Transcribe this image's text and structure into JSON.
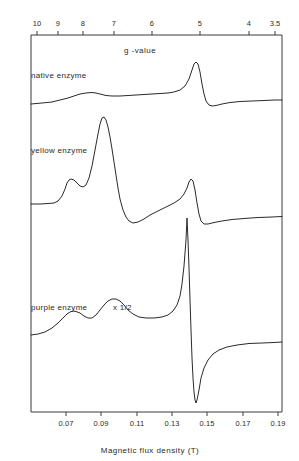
{
  "figure": {
    "kind": "epr-spectra-stack",
    "background_color": "#ffffff",
    "line_color": "#2a2a2a",
    "frame": {
      "left": 31,
      "right": 282,
      "top": 35,
      "bottom": 412
    }
  },
  "top_axis": {
    "title": "g -value",
    "title_x": 140,
    "title_y": 46,
    "ticks": [
      {
        "label": "10",
        "x": 37
      },
      {
        "label": "9",
        "x": 58
      },
      {
        "label": "8",
        "x": 83
      },
      {
        "label": "7",
        "x": 114
      },
      {
        "label": "6",
        "x": 152
      },
      {
        "label": "5",
        "x": 200
      },
      {
        "label": "4",
        "x": 249
      },
      {
        "label": "3.5",
        "x": 275
      }
    ]
  },
  "bottom_axis": {
    "title": "Magnetic  flux  density  (T)",
    "title_x": 150,
    "title_y": 446,
    "ticks": [
      {
        "label": "0.07",
        "x": 66
      },
      {
        "label": "0.09",
        "x": 101
      },
      {
        "label": "0.11",
        "x": 137
      },
      {
        "label": "0.13",
        "x": 172
      },
      {
        "label": "0.15",
        "x": 207
      },
      {
        "label": "0.17",
        "x": 243
      },
      {
        "label": "0.19",
        "x": 278
      }
    ]
  },
  "traces": [
    {
      "name": "native enzyme",
      "label": "native enzyme",
      "multiplier": "",
      "label_x": 31,
      "label_y": 71,
      "path": "M31,104 L42,103 L52,102 L60,100 L68,98 L74,96 L80,94 L86,93 L92,92.5 L96,93 L100,94 L106,95.5 L112,96 L120,96 L128,95.5 L136,95 L144,94.5 L152,94 L160,93.5 L168,93 L174,92 L180,90 L185,86 L189,79 L192,70 L194,64 L196,62 L198,64 L200,72 L202,84 L204,94 L206,101 L209,105 L212,106 L216,105.5 L222,104 L230,102.5 L240,101.5 L252,101 L264,100.5 L275,100 L282,100"
    },
    {
      "name": "yellow enzyme",
      "label": "yellow enzyme",
      "multiplier": "",
      "label_x": 31,
      "label_y": 146,
      "path": "M31,204 L40,204 L48,203.5 L54,203 L58,201 L62,196 L65,189 L67,183 L69,180 L71,179 L74,180 L77,183 L80,186 L83,187 L86,185 L89,178 L92,166 L95,150 L98,134 L100,124 L102,118 L104,117 L106,120 L108,127 L110,137 L112,149 L114,162 L116,175 L118,188 L120,199 L123,210 L126,217 L129,221 L133,223 L138,222 L144,219 L150,215 L158,211 L166,207 L174,203 L180,199 L184,194 L187,188 L189,182 L191,179 L193,181 L195,190 L197,203 L199,214 L201,221 L204,224 L208,224 L214,222.5 L222,221 L232,219.5 L244,218.5 L258,217.5 L272,217 L282,216.5"
    },
    {
      "name": "purple enzyme",
      "label": "purple enzyme",
      "multiplier": "x 1/2",
      "label_x": 31,
      "label_y": 303,
      "path": "M31,335 L38,334 L45,332 L52,328 L58,323 L63,318 L67,314 L70,312 L73,311 L76,311.5 L80,313 L84,316 L88,318 L92,318 L96,315 L100,310 L104,305 L108,301 L112,299 L116,299 L120,301 L124,305 L128,310 L133,314 L139,317 L146,318 L154,318 L162,317 L168,315 L173,311 L177,305 L180,296 L182,284 L184,266 L186,240 L187,218 L188,240 L189,268 L190,300 L191,330 L192,358 L193,378 L194,392 L195,400 L196,403 L197,400 L199,390 L201,378 L204,368 L208,360 L213,354 L219,350 L227,347 L237,345 L249,343.5 L262,343 L274,342.5 L282,342"
    }
  ]
}
